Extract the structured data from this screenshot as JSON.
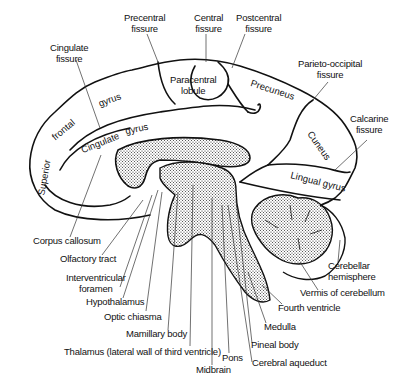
{
  "diagram": {
    "top_labels": {
      "precentral_fissure": "Precentral\nfissure",
      "central_fissure": "Central\nfissure",
      "postcentral_fissure": "Postcentral\nfissure",
      "cingulate_fissure": "Cingulate\nfissure",
      "parieto_occipital_fissure": "Parieto-occipital\nfissure",
      "calcarine_fissure": "Calcarine\nfissure"
    },
    "region_labels": {
      "paracentral_lobule": "Paracentral\nlobule",
      "precuneus": "Precuneus",
      "cuneus": "Cuneus",
      "lingual_gyrus": "Lingual gyrus",
      "frontal": "frontal",
      "gyrus_upper": "gyrus",
      "cingulate": "Cingulate",
      "gyrus_cingulate": "gyrus",
      "superior": "Superior"
    },
    "bottom_labels": {
      "corpus_callosum": "Corpus callosum",
      "olfactory_tract": "Olfactory tract",
      "interventricular_foramen": "Interventricular\nforamen",
      "hypothalamus": "Hypothalamus",
      "optic_chiasma": "Optic chiasma",
      "mamillary_body": "Mamillary body",
      "thalamus": "Thalamus (lateral wall of third ventricle)",
      "midbrain": "Midbrain",
      "pons": "Pons",
      "cerebral_aqueduct": "Cerebral aqueduct",
      "pineal_body": "Pineal body",
      "medulla": "Medulla",
      "fourth_ventricle": "Fourth ventricle",
      "vermis": "Vermis of cerebellum",
      "cerebellar_hemisphere": "Cerebellar\nhemisphere"
    }
  }
}
